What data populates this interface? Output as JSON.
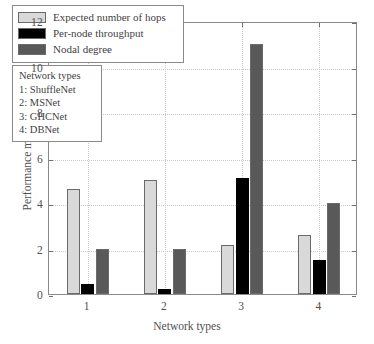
{
  "chart_data": {
    "type": "bar",
    "title": "",
    "xlabel": "Network types",
    "ylabel": "Performance metric",
    "categories": [
      "1",
      "2",
      "3",
      "4"
    ],
    "xtick_labels": [
      "1",
      "2",
      "3",
      "4"
    ],
    "ytick_labels": [
      "0",
      "2",
      "4",
      "6",
      "8",
      "10",
      "12"
    ],
    "ytick_values": [
      0,
      2,
      4,
      6,
      8,
      10,
      12
    ],
    "ylim": [
      0,
      12
    ],
    "grid": true,
    "grid_style": "dotted",
    "legend_position": "upper-left-inside",
    "series": [
      {
        "name": "Expected number of hops",
        "color": "#d9d9d9",
        "values": [
          4.6,
          5.0,
          2.15,
          2.6
        ]
      },
      {
        "name": "Per-node throughput",
        "color": "#000000",
        "values": [
          0.45,
          0.2,
          5.1,
          1.5
        ]
      },
      {
        "name": "Nodal degree",
        "color": "#595959",
        "values": [
          2.0,
          2.0,
          11.0,
          4.0
        ]
      }
    ],
    "annotations": {
      "network_types_title": "Network types",
      "network_types": [
        "1: ShuffleNet",
        "2: MSNet",
        "3: GHCNet",
        "4: DBNet"
      ]
    }
  },
  "legend": {
    "items": [
      {
        "label": "Expected number of hops",
        "color": "#d9d9d9"
      },
      {
        "label": "Per-node throughput",
        "color": "#000000"
      },
      {
        "label": "Nodal degree",
        "color": "#595959"
      }
    ]
  },
  "types_box": {
    "title": "Network types",
    "lines": [
      "1: ShuffleNet",
      "2: MSNet",
      "3: GHCNet",
      "4: DBNet"
    ]
  },
  "axes": {
    "x_title": "Network types",
    "y_title": "Performance metric"
  }
}
